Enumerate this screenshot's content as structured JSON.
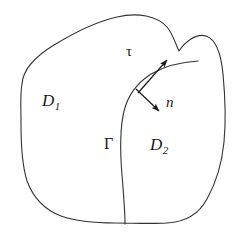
{
  "figure": {
    "type": "geometry-diagram",
    "background_color": "#ffffff",
    "stroke_color": "#333333",
    "stroke_width": 1,
    "labels": {
      "domain_1": {
        "base": "D",
        "subscript": "1",
        "meaning": "left subdomain"
      },
      "domain_2": {
        "base": "D",
        "subscript": "2",
        "meaning": "right subdomain"
      },
      "interface": {
        "text": "Γ",
        "meaning": "interface curve separating D1 and D2"
      },
      "tangent_vector": {
        "text": "τ",
        "meaning": "tangent vector to the interface"
      },
      "normal_vector": {
        "text": "n",
        "meaning": "unit normal vector to the interface"
      }
    },
    "geometry": {
      "outer_boundary_path": "M 22 84 C 24 70, 38 58, 56 46 C 74 34, 96 22, 118 17 C 140 12, 158 16, 168 26 C 174 32, 176 42, 180 50 C 186 42, 196 34, 206 36 C 216 38, 222 52, 224 74 C 226 96, 226 122, 224 142 C 222 162, 216 182, 208 198 C 200 214, 186 222, 168 223 C 150 224, 132 223, 114 223 C 96 223, 78 222, 62 216 C 46 210, 34 198, 28 182 C 22 166, 20 146, 20 124 C 20 104, 20 94, 22 84 Z",
      "interface_path": "M 198 61 C 182 62, 166 66, 152 74 C 138 82, 128 94, 124 110 C 120 126, 120 150, 122 174 C 124 198, 125 214, 125 224",
      "tangent_arrow": {
        "x1": 138,
        "y1": 93,
        "x2": 169,
        "y2": 58
      },
      "normal_arrow": {
        "x1": 136,
        "y1": 89,
        "x2": 161,
        "y2": 113
      }
    }
  }
}
